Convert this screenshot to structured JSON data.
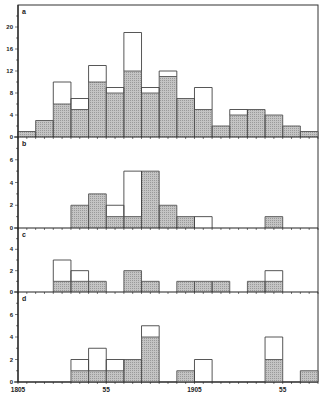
{
  "chart_data": {
    "type": "bar",
    "subtype": "stacked-histogram (outline = total, shaded = subset)",
    "x_start": 1805,
    "bin_width_years": 10,
    "categories": [
      "1805",
      "1815",
      "1825",
      "1835",
      "1845",
      "1855",
      "1865",
      "1875",
      "1885",
      "1895",
      "1905",
      "1915",
      "1925",
      "1935",
      "1945",
      "1955",
      "1965"
    ],
    "x_tick_labels": [
      {
        "bin_edge": 0,
        "label": "1805"
      },
      {
        "bin_edge": 5,
        "label": "55"
      },
      {
        "bin_edge": 10,
        "label": "1905"
      },
      {
        "bin_edge": 15,
        "label": "55"
      }
    ],
    "panels": [
      {
        "label": "a",
        "ylim": [
          0,
          24
        ],
        "yticks": [
          0,
          4,
          8,
          12,
          16,
          20
        ],
        "series": [
          {
            "name": "total (outline)",
            "values": [
              1,
              3,
              10,
              7,
              13,
              9,
              19,
              9,
              12,
              7,
              9,
              2,
              5,
              5,
              4,
              2,
              1
            ]
          },
          {
            "name": "shaded",
            "values": [
              1,
              3,
              6,
              5,
              10,
              8,
              12,
              8,
              11,
              7,
              5,
              2,
              4,
              5,
              4,
              2,
              1
            ]
          }
        ]
      },
      {
        "label": "b",
        "ylim": [
          0,
          8
        ],
        "yticks": [
          0,
          2,
          4,
          6
        ],
        "series": [
          {
            "name": "total (outline)",
            "values": [
              0,
              0,
              0,
              2,
              3,
              2,
              5,
              5,
              2,
              1,
              1,
              0,
              0,
              0,
              1,
              0,
              0
            ]
          },
          {
            "name": "shaded",
            "values": [
              0,
              0,
              0,
              2,
              3,
              1,
              1,
              5,
              2,
              1,
              0,
              0,
              0,
              0,
              1,
              0,
              0
            ]
          }
        ]
      },
      {
        "label": "c",
        "ylim": [
          0,
          6
        ],
        "yticks": [
          0,
          2,
          4
        ],
        "series": [
          {
            "name": "total (outline)",
            "values": [
              0,
              0,
              3,
              2,
              1,
              0,
              2,
              1,
              0,
              1,
              1,
              1,
              0,
              1,
              2,
              0,
              0
            ]
          },
          {
            "name": "shaded",
            "values": [
              0,
              0,
              1,
              1,
              1,
              0,
              2,
              1,
              0,
              1,
              1,
              1,
              0,
              1,
              1,
              0,
              0
            ]
          }
        ]
      },
      {
        "label": "d",
        "ylim": [
          0,
          8
        ],
        "yticks": [
          0,
          2,
          4,
          6
        ],
        "series": [
          {
            "name": "total (outline)",
            "values": [
              0,
              0,
              0,
              2,
              3,
              2,
              2,
              5,
              0,
              1,
              2,
              0,
              0,
              0,
              4,
              0,
              1
            ]
          },
          {
            "name": "shaded",
            "values": [
              0,
              0,
              0,
              1,
              1,
              1,
              2,
              4,
              0,
              1,
              0,
              0,
              0,
              0,
              2,
              0,
              1
            ]
          }
        ]
      }
    ],
    "title": "",
    "xlabel": "",
    "ylabel": "",
    "grid": false,
    "legend": "none"
  },
  "colors": {
    "shade": "#bdbdbd",
    "outline": "#444444",
    "axis": "#222222"
  }
}
